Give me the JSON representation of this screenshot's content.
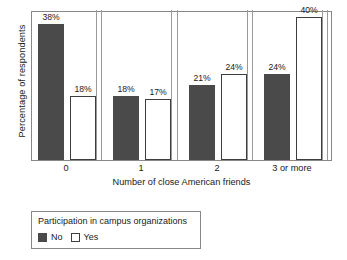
{
  "chart_data": {
    "type": "bar",
    "title": "",
    "xlabel": "Number of close American friends",
    "ylabel": "Percentage of respondents",
    "categories": [
      "0",
      "1",
      "2",
      "3 or more"
    ],
    "series": [
      {
        "name": "No",
        "color": "#4a4a4a",
        "values": [
          38,
          18,
          21,
          24
        ],
        "labels": [
          "38%",
          "18%",
          "21%",
          "24%"
        ]
      },
      {
        "name": "Yes",
        "color": "#ffffff",
        "values": [
          18,
          17,
          24,
          40
        ],
        "labels": [
          "18%",
          "17%",
          "24%",
          "40%"
        ]
      }
    ],
    "ylim": [
      0,
      42
    ],
    "grid": false,
    "legend_position": "below-plot",
    "legend_title": "Participation in campus organizations"
  },
  "axes": {
    "y_title": "Percentage of respondents",
    "x_title": "Number of close American friends",
    "x_ticks": [
      "0",
      "1",
      "2",
      "3 or more"
    ]
  },
  "legend": {
    "title": "Participation in campus organizations",
    "entries": [
      {
        "label": "No",
        "swatch": "filled-dark-square"
      },
      {
        "label": "Yes",
        "swatch": "open-white-square"
      }
    ]
  },
  "colors": {
    "bar_no_fill": "#4a4a4a",
    "bar_yes_fill": "#ffffff",
    "bar_yes_border": "#3d3d3d",
    "frame": "#888888",
    "text": "#1a1a1a",
    "background": "#ffffff"
  }
}
